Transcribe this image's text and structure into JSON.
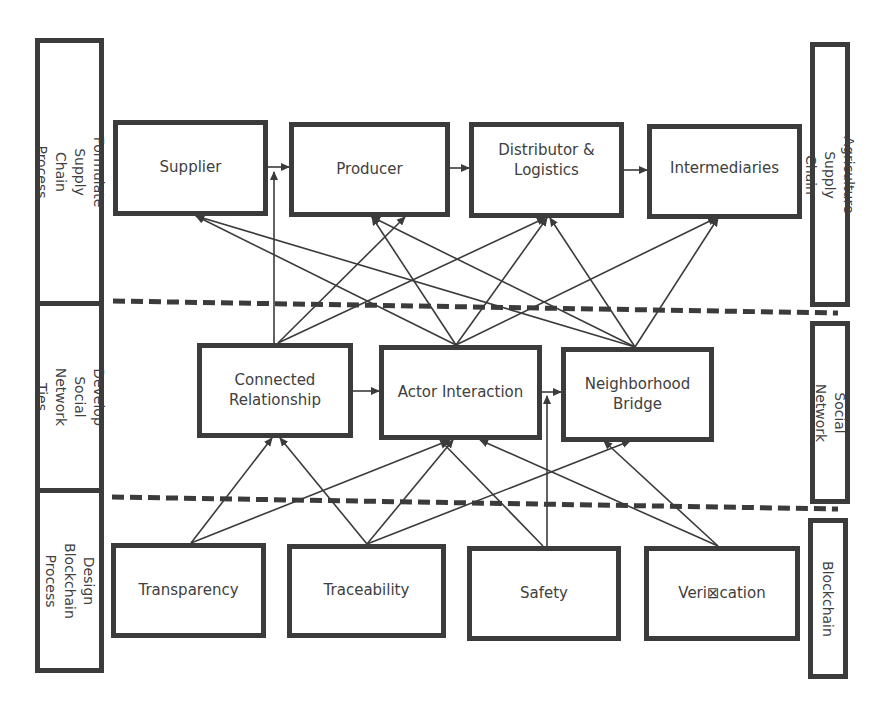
{
  "left_column": {
    "sections": [
      {
        "label": "Formulate Supply Chain Process"
      },
      {
        "label": "Develop Social\nNetwork Ties"
      },
      {
        "label": "Design Blockchain\nProcess"
      }
    ]
  },
  "right_column": {
    "sections": [
      {
        "label": "Agriculture Supply Chain"
      },
      {
        "label": "Social Network"
      },
      {
        "label": "Blockchain"
      }
    ]
  },
  "layers": {
    "supply_chain": {
      "nodes": [
        {
          "label": "Supplier"
        },
        {
          "label": "Producer"
        },
        {
          "label": "Distributor &\nLogistics"
        },
        {
          "label": "Intermediaries"
        }
      ]
    },
    "social_network": {
      "nodes": [
        {
          "label": "Connected\nRelationship"
        },
        {
          "label": "Actor Interaction"
        },
        {
          "label": "Neighborhood\nBridge"
        }
      ]
    },
    "blockchain": {
      "nodes": [
        {
          "label": "Transparency"
        },
        {
          "label": "Traceability"
        },
        {
          "label": "Safety"
        },
        {
          "label": "Veri⊠cation"
        }
      ]
    }
  },
  "edges": [
    {
      "from": "Supplier",
      "to": "Producer"
    },
    {
      "from": "Producer",
      "to": "Distributor & Logistics"
    },
    {
      "from": "Distributor & Logistics",
      "to": "Intermediaries"
    },
    {
      "from": "Connected Relationship",
      "to": "Actor Interaction"
    },
    {
      "from": "Actor Interaction",
      "to": "Neighborhood Bridge"
    },
    {
      "from": "Connected Relationship",
      "to": "Supplier-Producer link"
    },
    {
      "from": "Connected Relationship",
      "to": "Producer"
    },
    {
      "from": "Connected Relationship",
      "to": "Distributor & Logistics"
    },
    {
      "from": "Actor Interaction",
      "to": "Supplier"
    },
    {
      "from": "Actor Interaction",
      "to": "Producer"
    },
    {
      "from": "Actor Interaction",
      "to": "Distributor & Logistics"
    },
    {
      "from": "Actor Interaction",
      "to": "Intermediaries"
    },
    {
      "from": "Neighborhood Bridge",
      "to": "Supplier"
    },
    {
      "from": "Neighborhood Bridge",
      "to": "Producer"
    },
    {
      "from": "Neighborhood Bridge",
      "to": "Distributor & Logistics"
    },
    {
      "from": "Neighborhood Bridge",
      "to": "Intermediaries"
    },
    {
      "from": "Transparency",
      "to": "Connected Relationship"
    },
    {
      "from": "Transparency",
      "to": "Actor Interaction"
    },
    {
      "from": "Traceability",
      "to": "Connected Relationship"
    },
    {
      "from": "Traceability",
      "to": "Actor Interaction"
    },
    {
      "from": "Traceability",
      "to": "Neighborhood Bridge"
    },
    {
      "from": "Safety",
      "to": "Actor Interaction"
    },
    {
      "from": "Safety",
      "to": "Actor-Neighborhood link"
    },
    {
      "from": "Verification",
      "to": "Actor Interaction"
    },
    {
      "from": "Verification",
      "to": "Neighborhood Bridge"
    }
  ],
  "colors": {
    "stroke": "#3b3b3b",
    "text": "#404040",
    "background": "#ffffff"
  }
}
